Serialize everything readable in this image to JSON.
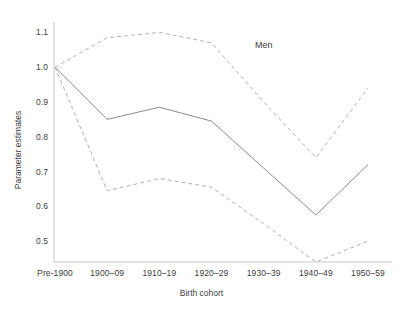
{
  "chart_data": {
    "type": "line",
    "title": "",
    "subtitle": "",
    "xlabel": "Birth cohort",
    "ylabel": "Parameter estimates",
    "categories": [
      "Pre-1900",
      "1900–09",
      "1910–19",
      "1920–29",
      "1930–39",
      "1940–49",
      "1950–59"
    ],
    "ytick_labels": [
      "1.1",
      "1.0",
      "0.9",
      "0.8",
      "0.7",
      "0.6",
      "0.5"
    ],
    "ytick_values": [
      1.1,
      1.0,
      0.9,
      0.8,
      0.7,
      0.6,
      0.5
    ],
    "ylim": [
      0.44,
      1.13
    ],
    "grid": false,
    "legend_position": "none",
    "annotations": [
      {
        "text": "Men",
        "x_category": "1930–39",
        "y": 1.06
      }
    ],
    "series": [
      {
        "name": "Parameter estimate",
        "style": "solid",
        "color": "#8a8a8a",
        "values": [
          1.0,
          0.85,
          0.885,
          0.845,
          0.71,
          0.575,
          0.72
        ]
      },
      {
        "name": "Upper 95% confidence limit",
        "style": "dashed",
        "color": "#b0b0b0",
        "values": [
          1.0,
          1.085,
          1.1,
          1.07,
          0.9,
          0.74,
          0.94
        ]
      },
      {
        "name": "Lower 95% confidence limit",
        "style": "dashed",
        "color": "#b0b0b0",
        "values": [
          1.0,
          0.645,
          0.68,
          0.655,
          0.55,
          0.44,
          0.5
        ]
      }
    ]
  },
  "axes": {
    "axis_color": "#c8c8c8"
  }
}
